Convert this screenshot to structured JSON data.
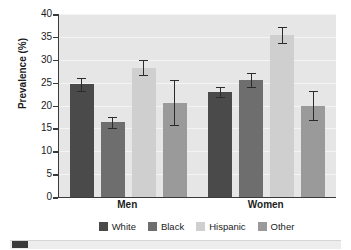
{
  "chart_data": {
    "type": "bar",
    "title": "",
    "xlabel": "",
    "ylabel": "Prevalence (%)",
    "ylim": [
      0,
      40
    ],
    "ytick_step": 5,
    "yticks": [
      "40",
      "35",
      "30",
      "25",
      "20",
      "15",
      "10",
      "5",
      "0"
    ],
    "grid": true,
    "legend_position": "bottom",
    "categories": [
      "Men",
      "Women"
    ],
    "series": [
      {
        "name": "White",
        "color": "#4a4a4a",
        "values": [
          24.7,
          23.0
        ],
        "err_low": [
          23.2,
          21.9
        ],
        "err_high": [
          26.1,
          24.0
        ]
      },
      {
        "name": "Black",
        "color": "#6e6e6e",
        "values": [
          16.3,
          25.6
        ],
        "err_low": [
          15.1,
          24.1
        ],
        "err_high": [
          17.4,
          27.1
        ]
      },
      {
        "name": "Hispanic",
        "color": "#cfcfcf",
        "values": [
          28.2,
          35.4
        ],
        "err_low": [
          26.6,
          33.7
        ],
        "err_high": [
          29.9,
          37.1
        ]
      },
      {
        "name": "Other",
        "color": "#9a9a9a",
        "values": [
          20.6,
          19.9
        ],
        "err_low": [
          15.7,
          16.8
        ],
        "err_high": [
          25.6,
          23.2
        ]
      }
    ]
  },
  "axis": {
    "y_title": "Prevalence (%)"
  },
  "legend": {
    "items": [
      {
        "label": "White",
        "color": "#4a4a4a"
      },
      {
        "label": "Black",
        "color": "#6e6e6e"
      },
      {
        "label": "Hispanic",
        "color": "#cfcfcf"
      },
      {
        "label": "Other",
        "color": "#9a9a9a"
      }
    ]
  },
  "groups": [
    {
      "label": "Men"
    },
    {
      "label": "Women"
    }
  ],
  "footer": {
    "swatch_color": "#3a3a3a"
  }
}
